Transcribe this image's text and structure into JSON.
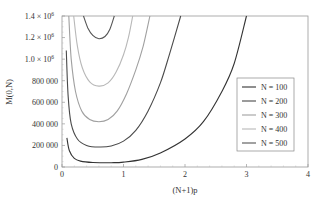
{
  "chart_data": {
    "type": "line",
    "title": "",
    "xlabel": "(N+1)p",
    "ylabel": "M(0,N)",
    "xlim": [
      0,
      4
    ],
    "ylim": [
      0,
      1400000
    ],
    "x_ticks": [
      {
        "value": 0,
        "label": "0"
      },
      {
        "value": 1,
        "label": "1"
      },
      {
        "value": 2,
        "label": "2"
      },
      {
        "value": 3,
        "label": "3"
      },
      {
        "value": 4,
        "label": "4"
      }
    ],
    "y_ticks": [
      {
        "value": 0,
        "label": "0"
      },
      {
        "value": 200000,
        "label": "200 000"
      },
      {
        "value": 400000,
        "label": "400 000"
      },
      {
        "value": 600000,
        "label": "600 000"
      },
      {
        "value": 800000,
        "label": "800 000"
      },
      {
        "value": 1000000,
        "label": "1.0 × 10",
        "exp": "6"
      },
      {
        "value": 1200000,
        "label": "1.2 × 10",
        "exp": "6"
      },
      {
        "value": 1400000,
        "label": "1.4 × 10",
        "exp": "6"
      }
    ],
    "grid": false,
    "legend_position": "right-center",
    "series": [
      {
        "name": "N = 100",
        "color": "#333333",
        "points": [
          [
            0.08,
            270000
          ],
          [
            0.12,
            150000
          ],
          [
            0.2,
            80000
          ],
          [
            0.3,
            55000
          ],
          [
            0.5,
            42000
          ],
          [
            0.8,
            40000
          ],
          [
            1.0,
            45000
          ],
          [
            1.3,
            70000
          ],
          [
            1.6,
            130000
          ],
          [
            2.0,
            260000
          ],
          [
            2.3,
            420000
          ],
          [
            2.6,
            700000
          ],
          [
            2.8,
            960000
          ],
          [
            3.0,
            1400000
          ]
        ]
      },
      {
        "name": "N = 200",
        "color": "#4a4a4a",
        "points": [
          [
            0.07,
            1080000
          ],
          [
            0.1,
            650000
          ],
          [
            0.15,
            400000
          ],
          [
            0.25,
            260000
          ],
          [
            0.4,
            200000
          ],
          [
            0.6,
            185000
          ],
          [
            0.8,
            195000
          ],
          [
            1.0,
            240000
          ],
          [
            1.2,
            340000
          ],
          [
            1.4,
            520000
          ],
          [
            1.6,
            780000
          ],
          [
            1.75,
            1050000
          ],
          [
            1.93,
            1400000
          ]
        ]
      },
      {
        "name": "N = 300",
        "color": "#a0a0a0",
        "points": [
          [
            0.11,
            1400000
          ],
          [
            0.15,
            1000000
          ],
          [
            0.22,
            700000
          ],
          [
            0.32,
            520000
          ],
          [
            0.45,
            440000
          ],
          [
            0.6,
            420000
          ],
          [
            0.75,
            440000
          ],
          [
            0.9,
            520000
          ],
          [
            1.05,
            680000
          ],
          [
            1.2,
            900000
          ],
          [
            1.32,
            1120000
          ],
          [
            1.43,
            1400000
          ]
        ]
      },
      {
        "name": "N = 400",
        "color": "#b8b8b8",
        "points": [
          [
            0.19,
            1400000
          ],
          [
            0.25,
            1120000
          ],
          [
            0.33,
            920000
          ],
          [
            0.45,
            790000
          ],
          [
            0.6,
            750000
          ],
          [
            0.75,
            780000
          ],
          [
            0.88,
            880000
          ],
          [
            1.0,
            1040000
          ],
          [
            1.08,
            1200000
          ],
          [
            1.15,
            1400000
          ]
        ]
      },
      {
        "name": "N = 500",
        "color": "#555555",
        "points": [
          [
            0.35,
            1400000
          ],
          [
            0.42,
            1290000
          ],
          [
            0.5,
            1220000
          ],
          [
            0.6,
            1190000
          ],
          [
            0.7,
            1210000
          ],
          [
            0.78,
            1280000
          ],
          [
            0.85,
            1400000
          ]
        ]
      }
    ]
  }
}
